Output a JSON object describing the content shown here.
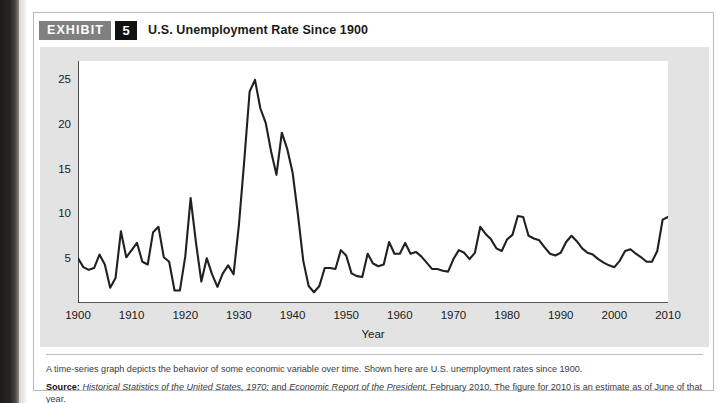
{
  "exhibit": {
    "badge_label": "EXHIBIT",
    "number": "5",
    "title": "U.S. Unemployment Rate Since 1900"
  },
  "footer": {
    "caption": "A time-series graph depicts the behavior of some economic variable over time. Shown here are U.S. unemployment rates since 1900.",
    "source_label": "Source:",
    "source_part1": "Historical Statistics of the United States, 1970;",
    "source_mid": " and ",
    "source_part2": "Economic Report of the President,",
    "source_part3": " February 2010. The figure for 2010 is an estimate as of June of that year."
  },
  "colors": {
    "badge_gray": "#808080",
    "badge_black": "#111111",
    "chart_background": "#e3e3e3",
    "plot_background": "#ffffff",
    "line": "#231f1f",
    "axis": "#231f1f"
  },
  "chart_data": {
    "type": "line",
    "title": "U.S. Unemployment Rate Since 1900",
    "xlabel": "Year",
    "ylabel": "Unemployment rate (percent)",
    "xlim": [
      1900,
      2010
    ],
    "ylim": [
      0,
      27
    ],
    "grid": false,
    "legend": null,
    "xticks": [
      1900,
      1910,
      1920,
      1930,
      1940,
      1950,
      1960,
      1970,
      1980,
      1990,
      2000,
      2010
    ],
    "yticks": [
      5,
      10,
      15,
      20,
      25
    ],
    "series": [
      {
        "name": "U.S. unemployment rate",
        "x": [
          1900,
          1901,
          1902,
          1903,
          1904,
          1905,
          1906,
          1907,
          1908,
          1909,
          1910,
          1911,
          1912,
          1913,
          1914,
          1915,
          1916,
          1917,
          1918,
          1919,
          1920,
          1921,
          1922,
          1923,
          1924,
          1925,
          1926,
          1927,
          1928,
          1929,
          1930,
          1931,
          1932,
          1933,
          1934,
          1935,
          1936,
          1937,
          1938,
          1939,
          1940,
          1941,
          1942,
          1943,
          1944,
          1945,
          1946,
          1947,
          1948,
          1949,
          1950,
          1951,
          1952,
          1953,
          1954,
          1955,
          1956,
          1957,
          1958,
          1959,
          1960,
          1961,
          1962,
          1963,
          1964,
          1965,
          1966,
          1967,
          1968,
          1969,
          1970,
          1971,
          1972,
          1973,
          1974,
          1975,
          1976,
          1977,
          1978,
          1979,
          1980,
          1981,
          1982,
          1983,
          1984,
          1985,
          1986,
          1987,
          1988,
          1989,
          1990,
          1991,
          1992,
          1993,
          1994,
          1995,
          1996,
          1997,
          1998,
          1999,
          2000,
          2001,
          2002,
          2003,
          2004,
          2005,
          2006,
          2007,
          2008,
          2009,
          2010
        ],
        "values": [
          5.0,
          4.0,
          3.7,
          3.9,
          5.4,
          4.3,
          1.7,
          2.8,
          8.0,
          5.1,
          5.9,
          6.7,
          4.6,
          4.3,
          7.9,
          8.5,
          5.1,
          4.6,
          1.4,
          1.4,
          5.2,
          11.7,
          6.7,
          2.4,
          5.0,
          3.2,
          1.8,
          3.3,
          4.2,
          3.2,
          8.7,
          15.9,
          23.6,
          24.9,
          21.7,
          20.1,
          16.9,
          14.3,
          19.0,
          17.2,
          14.6,
          9.9,
          4.7,
          1.9,
          1.2,
          1.9,
          3.9,
          3.9,
          3.8,
          5.9,
          5.3,
          3.3,
          3.0,
          2.9,
          5.5,
          4.4,
          4.1,
          4.3,
          6.8,
          5.5,
          5.5,
          6.7,
          5.5,
          5.7,
          5.2,
          4.5,
          3.8,
          3.8,
          3.6,
          3.5,
          4.9,
          5.9,
          5.6,
          4.9,
          5.6,
          8.5,
          7.7,
          7.1,
          6.1,
          5.8,
          7.1,
          7.6,
          9.7,
          9.6,
          7.5,
          7.2,
          7.0,
          6.2,
          5.5,
          5.3,
          5.6,
          6.8,
          7.5,
          6.9,
          6.1,
          5.6,
          5.4,
          4.9,
          4.5,
          4.2,
          4.0,
          4.7,
          5.8,
          6.0,
          5.5,
          5.1,
          4.6,
          4.6,
          5.8,
          9.3,
          9.6
        ]
      }
    ]
  }
}
